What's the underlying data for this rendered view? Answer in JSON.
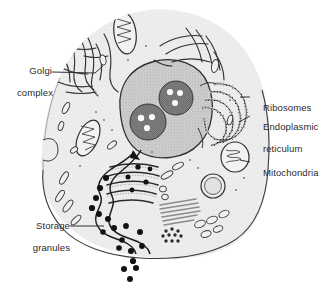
{
  "figure": {
    "type": "biological-diagram",
    "background_color": "#ffffff",
    "ink_color": "#2b2b2b",
    "cytoplasm_fill": "#ececec",
    "nucleus_fill": "#c9c9c9",
    "nucleolus_fill": "#6e6e6e",
    "granule_color": "#121212"
  },
  "labels": {
    "golgi": {
      "line1": "Golgi",
      "line2": "complex"
    },
    "ribosomes": {
      "line1": "Ribosomes"
    },
    "endoplasmic_reticulum": {
      "line1": "Endoplasmic",
      "line2": "reticulum"
    },
    "mitochondria": {
      "line1": "Mitochondria"
    },
    "storage_granules": {
      "line1": "Storage",
      "line2": "granules"
    }
  },
  "structures": {
    "nucleus": {
      "name": "nucleus",
      "nucleoli_count": 2
    },
    "nucleoli": [
      {
        "name": "nucleolus-upper-right",
        "vacuoles": 3
      },
      {
        "name": "nucleolus-lower-left",
        "vacuoles": 3
      }
    ],
    "mitochondria": [
      {
        "name": "mitochondrion-top-center"
      },
      {
        "name": "mitochondrion-left-middle"
      },
      {
        "name": "mitochondrion-right-edge"
      }
    ],
    "golgi_stacks": {
      "name": "golgi-apparatus",
      "cisternae": 5
    },
    "rough_er_right": {
      "name": "rough-endoplasmic-reticulum",
      "whorls": 4
    },
    "rough_er_upper_left": {
      "name": "endoplasmic-reticulum-upper-left"
    },
    "lysosome": {
      "name": "lysosome-vacuole"
    },
    "glycogen_rosette": {
      "name": "glycogen-rosette"
    },
    "filament_bundle": {
      "name": "microfilament-bundle"
    },
    "secretory_granules_inside": 11,
    "secretory_granules_outside": 7
  }
}
